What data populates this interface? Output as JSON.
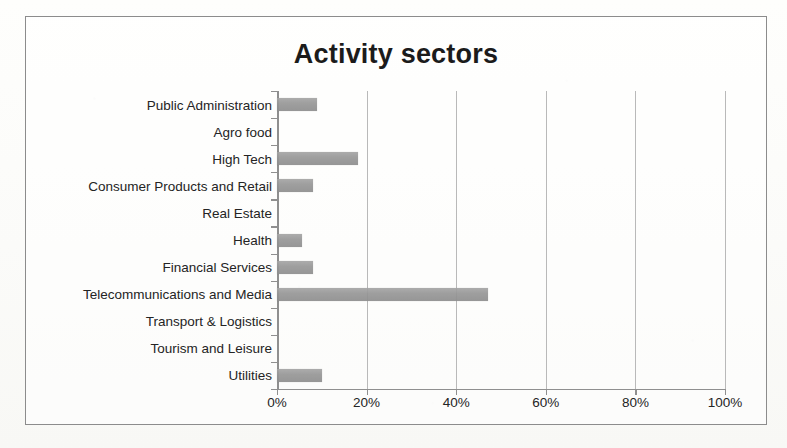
{
  "chart_data": {
    "type": "bar",
    "orientation": "horizontal",
    "title": "Activity sectors",
    "xlabel": "",
    "ylabel": "",
    "categories": [
      "Public Administration",
      "Agro food",
      "High Tech",
      "Consumer Products and Retail",
      "Real Estate",
      "Health",
      "Financial Services",
      "Telecommunications and Media",
      "Transport & Logistics",
      "Tourism and Leisure",
      "Utilities"
    ],
    "values": [
      9,
      0,
      18,
      8,
      0,
      5.5,
      8,
      47,
      0,
      0,
      10
    ],
    "value_unit": "%",
    "xlim": [
      0,
      100
    ],
    "xticks": [
      0,
      20,
      40,
      60,
      80,
      100
    ],
    "xtick_labels": [
      "0%",
      "20%",
      "40%",
      "60%",
      "80%",
      "100%"
    ],
    "grid": true,
    "grid_axis": "x",
    "legend": false,
    "legend_position": "none",
    "series": [
      {
        "name": "Activity sectors",
        "color": "#969696",
        "values": [
          9,
          0,
          18,
          8,
          0,
          5.5,
          8,
          47,
          0,
          0,
          10
        ]
      }
    ]
  },
  "colors": {
    "bar": "#969696",
    "gridline": "#b9b9b9",
    "axis": "#8f8f8f",
    "border": "#8c8c8c",
    "text": "#242424",
    "title": "#1b1b1b",
    "background": "#fdfdfb"
  }
}
